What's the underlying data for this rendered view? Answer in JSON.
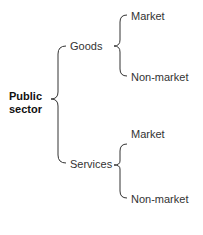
{
  "diagram": {
    "root": {
      "line1": "Public",
      "line2": "sector"
    },
    "branches": [
      {
        "label": "Goods",
        "children": [
          {
            "label": "Market"
          },
          {
            "label": "Non-market"
          }
        ]
      },
      {
        "label": "Services",
        "children": [
          {
            "label": "Market"
          },
          {
            "label": "Non-market"
          }
        ]
      }
    ]
  }
}
